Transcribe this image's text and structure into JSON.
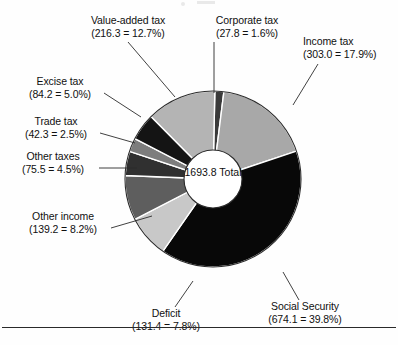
{
  "chart_data": {
    "type": "pie",
    "title": "",
    "subtitle": "",
    "xlabel": "",
    "ylabel": "",
    "grid": false,
    "legend_position": "outside-callouts",
    "donut": true,
    "center_value": "1693.8",
    "center_label": "Total",
    "total": 1693.8,
    "unit": "",
    "categories": [
      "Corporate tax",
      "Income tax",
      "Social Security",
      "Deficit",
      "Other income",
      "Other taxes",
      "Trade tax",
      "Excise tax",
      "Value-added tax"
    ],
    "values": [
      27.8,
      303.0,
      674.1,
      131.4,
      139.2,
      75.5,
      42.3,
      84.2,
      216.3
    ],
    "percents": [
      1.6,
      17.9,
      39.8,
      7.8,
      8.2,
      4.5,
      2.5,
      5.0,
      12.7
    ],
    "colors": [
      "#3a3a3a",
      "#a8a8a8",
      "#080808",
      "#c8c8c8",
      "#5e5e5e",
      "#303030",
      "#7d7d7d",
      "#141414",
      "#b4b4b4"
    ],
    "slices": [
      {
        "name": "Corporate tax",
        "value": 27.8,
        "percent": 1.6,
        "color": "#3a3a3a",
        "label_line1": "Corporate tax",
        "label_line2": "(27.8 = 1.6%)"
      },
      {
        "name": "Income tax",
        "value": 303.0,
        "percent": 17.9,
        "color": "#a8a8a8",
        "label_line1": "Income tax",
        "label_line2": "(303.0 = 17.9%)"
      },
      {
        "name": "Social Security",
        "value": 674.1,
        "percent": 39.8,
        "color": "#080808",
        "label_line1": "Social Security",
        "label_line2": "(674.1 = 39.8%)"
      },
      {
        "name": "Deficit",
        "value": 131.4,
        "percent": 7.8,
        "color": "#c8c8c8",
        "label_line1": "Deficit",
        "label_line2": "(131.4 = 7.8%)"
      },
      {
        "name": "Other income",
        "value": 139.2,
        "percent": 8.2,
        "color": "#5e5e5e",
        "label_line1": "Other income",
        "label_line2": "(139.2 = 8.2%)"
      },
      {
        "name": "Other taxes",
        "value": 75.5,
        "percent": 4.5,
        "color": "#303030",
        "label_line1": "Other taxes",
        "label_line2": "(75.5 = 4.5%)"
      },
      {
        "name": "Trade tax",
        "value": 42.3,
        "percent": 2.5,
        "color": "#7d7d7d",
        "label_line1": "Trade tax",
        "label_line2": "(42.3 = 2.5%)"
      },
      {
        "name": "Excise tax",
        "value": 84.2,
        "percent": 5.0,
        "color": "#141414",
        "label_line1": "Excise tax",
        "label_line2": "(84.2 = 5.0%)"
      },
      {
        "name": "Value-added tax",
        "value": 216.3,
        "percent": 12.7,
        "color": "#b4b4b4",
        "label_line1": "Value-added tax",
        "label_line2": "(216.3 = 12.7%)"
      }
    ]
  },
  "labels": {
    "value_added_tax": {
      "line1": "Value-added tax",
      "line2": "(216.3 = 12.7%)"
    },
    "corporate_tax": {
      "line1": "Corporate tax",
      "line2": "(27.8 = 1.6%)"
    },
    "income_tax": {
      "line1": "Income tax",
      "line2": "(303.0 = 17.9%)"
    },
    "excise_tax": {
      "line1": "Excise tax",
      "line2": "(84.2 = 5.0%)"
    },
    "trade_tax": {
      "line1": "Trade tax",
      "line2": "(42.3 = 2.5%)"
    },
    "other_taxes": {
      "line1": "Other taxes",
      "line2": "(75.5 = 4.5%)"
    },
    "other_income": {
      "line1": "Other income",
      "line2": "(139.2 = 8.2%)"
    },
    "deficit": {
      "line1": "Deficit",
      "line2": "(131.4 = 7.8%)"
    },
    "social_security": {
      "line1": "Social Security",
      "line2": "(674.1 = 39.8%)"
    }
  },
  "center": {
    "value": "1693.8",
    "caption": "Total"
  },
  "style": {
    "background": "#fefefe",
    "text_color": "#101010",
    "rule_color": "#2a2a2a",
    "outline_color": "#2b2b2b",
    "hole_fill": "#ffffff"
  }
}
